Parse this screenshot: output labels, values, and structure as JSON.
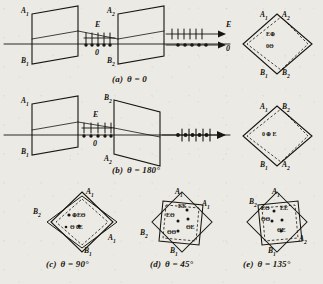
{
  "figure": {
    "ink_color": "#17150f",
    "paper_color": "#eceae4",
    "symbols": {
      "extraordinary": "E",
      "ordinary": "0",
      "ticks_meaning": "E-polarization (vertical ticks)",
      "dots_meaning": "0-polarization (dots)",
      "circle_dot": "Θ",
      "circle_cross": "⊕"
    }
  },
  "panels": [
    {
      "id": "a",
      "caption_label": "(a)",
      "caption_text": "θ = 0",
      "plate1": {
        "top": "A",
        "top_sub": "1",
        "bottom": "B",
        "bottom_sub": "1"
      },
      "plate2": {
        "top": "A",
        "top_sub": "2",
        "bottom": "B",
        "bottom_sub": "2"
      },
      "mid_beam": {
        "upper": "E",
        "lower": "0"
      },
      "out_beam": {
        "upper": "E",
        "lower": "0"
      },
      "split_output": true,
      "inset": {
        "corners": {
          "top_left": "A",
          "top_left_sub": "1",
          "top_right": "A",
          "top_right_sub": "2",
          "bottom_left": "B",
          "bottom_left_sub": "1",
          "bottom_right": "B",
          "bottom_right_sub": "2"
        },
        "center_lines": [
          "E⊕",
          "0Θ"
        ]
      }
    },
    {
      "id": "b",
      "caption_label": "(b)",
      "caption_text": "θ = 180°",
      "plate1": {
        "top": "A",
        "top_sub": "1",
        "bottom": "B",
        "bottom_sub": "1"
      },
      "plate2": {
        "top": "B",
        "top_sub": "2",
        "bottom": "A",
        "bottom_sub": "2"
      },
      "mid_beam": {
        "upper": "E",
        "lower": "0"
      },
      "out_beam": {
        "upper": "",
        "lower": ""
      },
      "split_output": false,
      "inset": {
        "corners": {
          "top_left": "A",
          "top_left_sub": "1",
          "top_right": "B",
          "top_right_sub": "2",
          "bottom_left": "B",
          "bottom_left_sub": "1",
          "bottom_right": "A",
          "bottom_right_sub": "2"
        },
        "center_lines": [
          "0 ⊕ E"
        ]
      }
    },
    {
      "id": "c",
      "caption_label": "(c)",
      "caption_text": "θ = 90°",
      "corners": {
        "top": "A",
        "top_sub": "1",
        "left": "B",
        "left_sub": "2",
        "right": "A",
        "right_sub": "1",
        "bottom": "B",
        "bottom_sub": "1"
      },
      "center_lines": [
        "⊕EΘ",
        "Θ 0E"
      ]
    },
    {
      "id": "d",
      "caption_label": "(d)",
      "caption_text": "θ = 45°",
      "corners": {
        "top": "A",
        "top_sub": "1",
        "left": "B",
        "left_sub": "2",
        "right": "A",
        "right_sub": "1",
        "bottom": "B",
        "bottom_sub": "1"
      },
      "center_lines": [
        "EE",
        "EΘ",
        "ΘE",
        "ΘΘ"
      ]
    },
    {
      "id": "e",
      "caption_label": "(e)",
      "caption_text": "θ = 135°",
      "corners": {
        "top": "A",
        "top_sub": "1",
        "left": "B",
        "left_sub": "2",
        "right": "A",
        "right_sub": "2",
        "bottom": "B",
        "bottom_sub": "1"
      },
      "center_lines": [
        "EΘ",
        "EE",
        "ΘΘ",
        "ΘE"
      ]
    }
  ]
}
